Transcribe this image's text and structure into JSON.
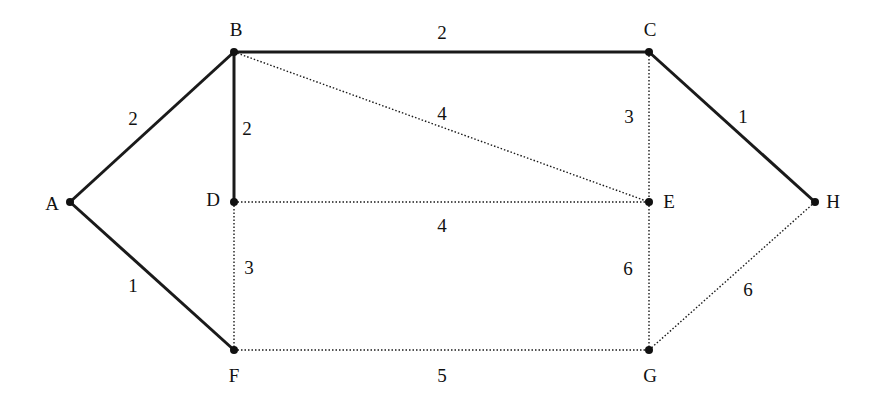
{
  "diagram": {
    "type": "weighted-graph",
    "nodes": [
      {
        "id": "A",
        "x": 70,
        "y": 202,
        "label": "A",
        "lx": 52,
        "ly": 210
      },
      {
        "id": "B",
        "x": 234,
        "y": 52,
        "label": "B",
        "lx": 236,
        "ly": 36
      },
      {
        "id": "C",
        "x": 649,
        "y": 52,
        "label": "C",
        "lx": 650,
        "ly": 36
      },
      {
        "id": "D",
        "x": 234,
        "y": 202,
        "label": "D",
        "lx": 213,
        "ly": 206
      },
      {
        "id": "E",
        "x": 649,
        "y": 202,
        "label": "E",
        "lx": 669,
        "ly": 208
      },
      {
        "id": "H",
        "x": 815,
        "y": 202,
        "label": "H",
        "lx": 833,
        "ly": 208
      },
      {
        "id": "F",
        "x": 234,
        "y": 350,
        "label": "F",
        "lx": 234,
        "ly": 382
      },
      {
        "id": "G",
        "x": 649,
        "y": 350,
        "label": "G",
        "lx": 650,
        "ly": 382
      }
    ],
    "edges": [
      {
        "from": "A",
        "to": "B",
        "weight": "2",
        "style": "solid",
        "wx": 133,
        "wy": 125
      },
      {
        "from": "A",
        "to": "F",
        "weight": "1",
        "style": "solid",
        "wx": 133,
        "wy": 292
      },
      {
        "from": "B",
        "to": "C",
        "weight": "2",
        "style": "solid",
        "wx": 442,
        "wy": 39
      },
      {
        "from": "B",
        "to": "D",
        "weight": "2",
        "style": "solid",
        "wx": 247,
        "wy": 135
      },
      {
        "from": "B",
        "to": "E",
        "weight": "4",
        "style": "dotted",
        "wx": 442,
        "wy": 120
      },
      {
        "from": "C",
        "to": "E",
        "weight": "3",
        "style": "dotted",
        "wx": 629,
        "wy": 123
      },
      {
        "from": "C",
        "to": "H",
        "weight": "1",
        "style": "solid",
        "wx": 743,
        "wy": 123
      },
      {
        "from": "D",
        "to": "E",
        "weight": "4",
        "style": "dotted",
        "wx": 442,
        "wy": 232
      },
      {
        "from": "D",
        "to": "F",
        "weight": "3",
        "style": "dotted",
        "wx": 249,
        "wy": 274
      },
      {
        "from": "E",
        "to": "G",
        "weight": "6",
        "style": "dotted",
        "wx": 628,
        "wy": 275
      },
      {
        "from": "F",
        "to": "G",
        "weight": "5",
        "style": "dotted",
        "wx": 442,
        "wy": 382
      },
      {
        "from": "G",
        "to": "H",
        "weight": "6",
        "style": "dotted",
        "wx": 748,
        "wy": 296
      }
    ],
    "colors": {
      "edge": "#1a1a1a",
      "node": "#111111",
      "background": "#ffffff"
    }
  }
}
